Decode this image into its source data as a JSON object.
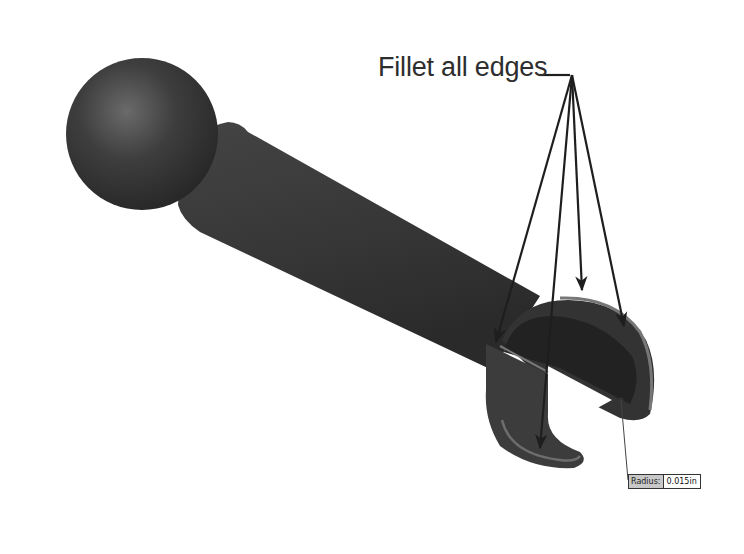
{
  "annotation": {
    "label": "Fillet all edges",
    "arrow_count": 5
  },
  "dimension": {
    "key": "Radius:",
    "value": "0.015in"
  },
  "model": {
    "description": "Ball-end rod with slotted cup end",
    "colors": {
      "body": "#3a3a3a",
      "highlight": "#6a6a6a",
      "fillet_edge": "#8a8a8a",
      "arrow": "#1e1e1e",
      "background": "#ffffff"
    }
  }
}
